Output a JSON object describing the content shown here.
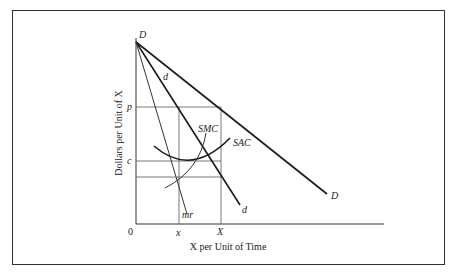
{
  "figure": {
    "type": "firm equilibrium diagram",
    "y_axis_label": "Dollars per Unit of X",
    "x_axis_label": "X per Unit of Time",
    "origin_label": "0",
    "y_ticks": [
      {
        "label": "p",
        "y": 107
      },
      {
        "label": "c",
        "y": 161
      }
    ],
    "x_ticks": [
      {
        "label": "x",
        "x": 179
      },
      {
        "label": "X",
        "x": 221
      }
    ],
    "curves": [
      {
        "name": "D",
        "label_start": "D",
        "label_end": "D",
        "kind": "market demand"
      },
      {
        "name": "d",
        "label_start": "d",
        "label_end": "d",
        "kind": "firm demand"
      },
      {
        "name": "mr",
        "label": "mr",
        "kind": "marginal revenue"
      },
      {
        "name": "SMC",
        "label": "SMC",
        "kind": "short-run marginal cost"
      },
      {
        "name": "SAC",
        "label": "SAC",
        "kind": "short-run average cost"
      }
    ]
  },
  "labels": {
    "D_top": "D",
    "D_end": "D",
    "d_top": "d",
    "d_end": "d",
    "mr": "mr",
    "SMC": "SMC",
    "SAC": "SAC",
    "p": "p",
    "c": "c",
    "zero": "0",
    "x_small": "x",
    "X_big": "X",
    "y_axis": "Dollars per Unit of X",
    "x_axis": "X per Unit of Time"
  },
  "colors": {
    "line": "#1a1a1a",
    "guide": "#555555",
    "frame": "#333333"
  }
}
